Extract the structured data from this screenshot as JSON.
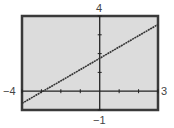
{
  "chart_data": {
    "type": "line",
    "title": "",
    "xlabel": "",
    "ylabel": "",
    "xlim": [
      -4,
      3
    ],
    "ylim": [
      -1,
      4
    ],
    "window_labels": {
      "xmin": "−4",
      "xmax": "3",
      "ymin": "−1",
      "ymax": "4"
    },
    "x_ticks": [
      -4,
      -3,
      -2,
      -1,
      0,
      1,
      2,
      3
    ],
    "y_ticks": [
      -1,
      0,
      1,
      2,
      3,
      4
    ],
    "grid": false,
    "series": [
      {
        "name": "line",
        "equation_estimate": "y = 0.6x + 1.75",
        "x": [
          -4,
          -3,
          -2,
          -1,
          0,
          1,
          2,
          3
        ],
        "y": [
          -0.65,
          -0.05,
          0.55,
          1.15,
          1.75,
          2.35,
          2.95,
          3.55
        ]
      }
    ],
    "x_intercept_estimate": -2.9,
    "y_intercept_estimate": 1.75
  },
  "colors": {
    "background": "#dcdcdc",
    "frame": "#3a3a3a",
    "axis": "#222222",
    "line": "#333333",
    "label": "#444444"
  }
}
